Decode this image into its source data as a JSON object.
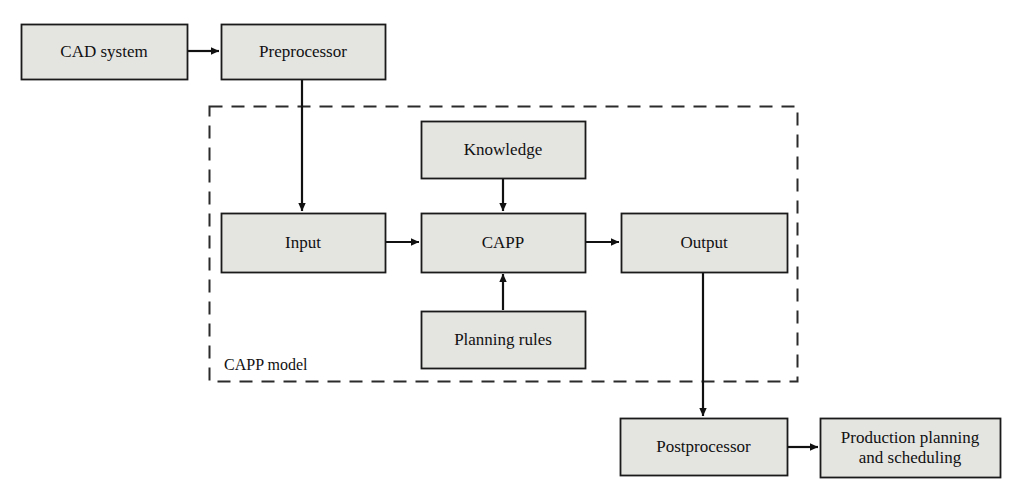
{
  "diagram": {
    "colors": {
      "box_fill": "#e4e4e1",
      "box_stroke": "#1a1a1a",
      "arrow": "#111111",
      "dashed_border": "#2b2b2b",
      "background": "#ffffff",
      "text": "#111111"
    },
    "group": {
      "label": "CAPP model",
      "label_x": 224,
      "label_y": 356,
      "x": 209,
      "y": 106,
      "width": 588,
      "height": 275,
      "style": "dashed"
    },
    "nodes": [
      {
        "id": "cad",
        "label": "CAD system",
        "x": 21,
        "y": 24,
        "w": 166,
        "h": 55
      },
      {
        "id": "pre",
        "label": "Preprocessor",
        "x": 221,
        "y": 24,
        "w": 164,
        "h": 55
      },
      {
        "id": "know",
        "label": "Knowledge",
        "x": 421,
        "y": 121,
        "w": 164,
        "h": 57
      },
      {
        "id": "in",
        "label": "Input",
        "x": 221,
        "y": 213,
        "w": 164,
        "h": 59
      },
      {
        "id": "capp",
        "label": "CAPP",
        "x": 421,
        "y": 213,
        "w": 164,
        "h": 59
      },
      {
        "id": "out",
        "label": "Output",
        "x": 621,
        "y": 213,
        "w": 166,
        "h": 59
      },
      {
        "id": "rules",
        "label": "Planning rules",
        "x": 421,
        "y": 311,
        "w": 164,
        "h": 57
      },
      {
        "id": "post",
        "label": "Postprocessor",
        "x": 620,
        "y": 418,
        "w": 167,
        "h": 57
      },
      {
        "id": "prod",
        "label": "Production planning\nand scheduling",
        "x": 820,
        "y": 418,
        "w": 180,
        "h": 59
      }
    ],
    "edges": [
      {
        "id": "cad-to-pre",
        "from": "cad",
        "to": "pre",
        "orientation": "horizontal",
        "points": [
          188,
          51,
          219,
          51
        ]
      },
      {
        "id": "pre-to-input",
        "from": "pre",
        "to": "in",
        "orientation": "vertical",
        "points": [
          302,
          80,
          302,
          211
        ]
      },
      {
        "id": "know-to-capp",
        "from": "know",
        "to": "capp",
        "orientation": "vertical",
        "points": [
          503,
          179,
          503,
          211
        ]
      },
      {
        "id": "input-to-capp",
        "from": "in",
        "to": "capp",
        "orientation": "horizontal",
        "points": [
          386,
          242,
          419,
          242
        ]
      },
      {
        "id": "rules-to-capp",
        "from": "rules",
        "to": "capp",
        "orientation": "vertical",
        "points": [
          503,
          310,
          503,
          274
        ]
      },
      {
        "id": "capp-to-out",
        "from": "capp",
        "to": "out",
        "orientation": "horizontal",
        "points": [
          586,
          242,
          619,
          242
        ]
      },
      {
        "id": "out-to-post",
        "from": "out",
        "to": "post",
        "orientation": "vertical",
        "points": [
          703,
          273,
          703,
          416
        ]
      },
      {
        "id": "post-to-prod",
        "from": "post",
        "to": "prod",
        "orientation": "horizontal",
        "points": [
          788,
          447,
          818,
          447
        ]
      }
    ]
  }
}
